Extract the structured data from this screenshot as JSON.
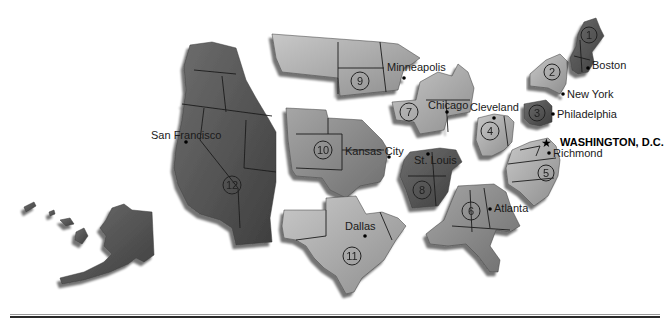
{
  "map": {
    "subject": "Federal Reserve Districts",
    "capital": {
      "label": "WASHINGTON, D.C.",
      "icon": "star-icon"
    },
    "districts": [
      {
        "number": "1",
        "city": "Boston"
      },
      {
        "number": "2",
        "city": "New York"
      },
      {
        "number": "3",
        "city": "Philadelphia"
      },
      {
        "number": "4",
        "city": "Cleveland"
      },
      {
        "number": "5",
        "city": "Richmond"
      },
      {
        "number": "6",
        "city": "Atlanta"
      },
      {
        "number": "7",
        "city": "Chicago"
      },
      {
        "number": "8",
        "city": "St. Louis"
      },
      {
        "number": "9",
        "city": "Minneapolis"
      },
      {
        "number": "10",
        "city": "Kansas City"
      },
      {
        "number": "11",
        "city": "Dallas"
      },
      {
        "number": "12",
        "city": "San Francisco"
      }
    ],
    "colors": {
      "dark_region": "#5a5a5a",
      "mid_region": "#8c8c8c",
      "light_region": "#b4b4b4",
      "shadow": "#3c3c3c",
      "text": "#1a1a1a"
    }
  }
}
